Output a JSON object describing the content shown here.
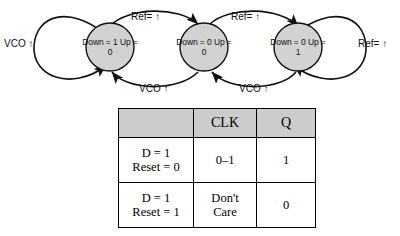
{
  "diagram": {
    "states": [
      {
        "id": "state-down",
        "line1": "Down = 1",
        "line2": "Up = 0"
      },
      {
        "id": "state-neutral",
        "line1": "Down = 0",
        "line2": "Up = 0"
      },
      {
        "id": "state-up",
        "line1": "Down = 0",
        "line2": "Up = 1"
      }
    ],
    "edges": [
      {
        "id": "self-loop-left",
        "label": "VCO ↑"
      },
      {
        "id": "top-left-arc",
        "label": "Ref= ↑"
      },
      {
        "id": "top-right-arc",
        "label": "Ref= ↑"
      },
      {
        "id": "self-loop-right",
        "label": "Ref= ↑"
      },
      {
        "id": "bottom-left-arc",
        "label": "VCO ↑"
      },
      {
        "id": "bottom-right-arc",
        "label": "VCO ↑"
      }
    ],
    "colors": {
      "state_fill": "#d2d2d2",
      "stroke": "#111111"
    }
  },
  "table": {
    "headers": [
      "",
      "CLK",
      "Q"
    ],
    "rows": [
      {
        "cond_line1": "D = 1",
        "cond_line2": "Reset = 0",
        "clk_line1": "0–1",
        "clk_line2": "",
        "q": "1"
      },
      {
        "cond_line1": "D = 1",
        "cond_line2": "Reset = 1",
        "clk_line1": "Don't",
        "clk_line2": "Care",
        "q": "0"
      }
    ],
    "colors": {
      "header_fill": "#cccccc",
      "border": "#000000"
    }
  }
}
